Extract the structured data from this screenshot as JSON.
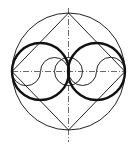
{
  "diagram": {
    "title": "",
    "stroke_color": "#222222",
    "background": "#ffffff",
    "center": [
      68.5,
      71.5
    ],
    "outer_circle": {
      "cx": 68.5,
      "cy": 71.5,
      "rx": 56.5,
      "ry": 58.5
    },
    "diamond": {
      "points": "68.5,13 12,71.5 68.5,130 125,71.5"
    },
    "thick_circles": [
      {
        "cx": 40.5,
        "cy": 71.5,
        "r": 28.5
      },
      {
        "cx": 96.5,
        "cy": 71.5,
        "r": 28.5
      }
    ],
    "center_circle": {
      "cx": 68.5,
      "cy": 71.5,
      "r": 14
    },
    "s_curves": [
      "M 12 71.5 A 14 14 0 0 0 40.5 71.5 A 14 14 0 0 1 68.5 71.5",
      "M 68.5 71.5 A 14 14 0 0 0 96.5 71.5 A 14 14 0 0 1 125 71.5"
    ],
    "centerlines": {
      "vertical": {
        "x": 68.5,
        "y1": 8,
        "y2": 142
      },
      "horizontal": {
        "y": 71.5,
        "x1": 12,
        "x2": 125
      }
    }
  }
}
